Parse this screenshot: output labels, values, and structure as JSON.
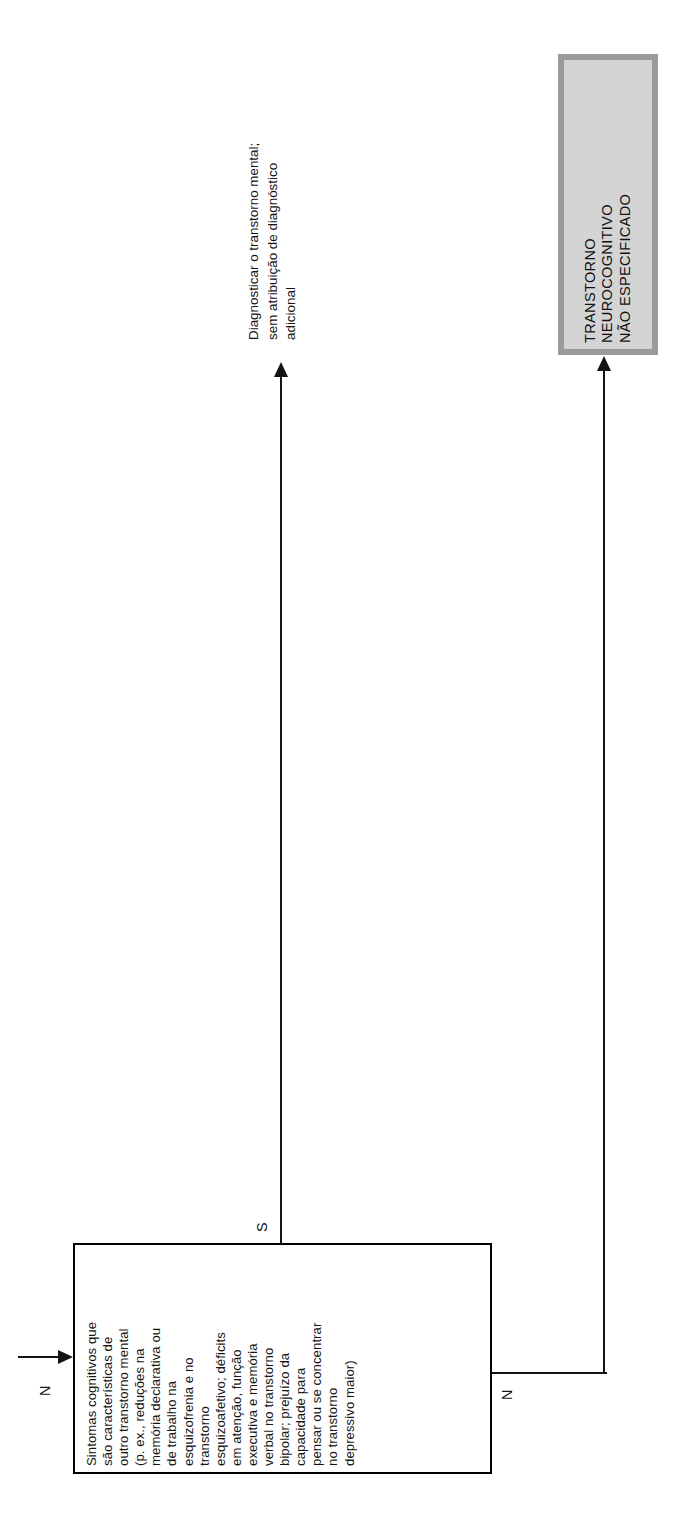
{
  "page": {
    "orientation": "rotated-90-ccw",
    "background_color": "#ffffff",
    "width": 676,
    "height": 1534
  },
  "diagram": {
    "type": "decision-tree-fragment",
    "language": "pt-BR",
    "criteria_node": {
      "id": "criteria-cognitive-symptoms",
      "shape": "rectangle",
      "fill_color": "#ffffff",
      "border_color": "#000000",
      "text": "Sintomas cognitivos que\nsão características de\noutro transtorno mental\n(p. ex., reduções  na\nmemória declarativa ou\nde trabalho na\nesquizofrenia e no\ntranstorno\nesquizoafetivo; déficits\nem atenção, função\nexecutiva e memória\nverbal no transtorno\nbipolar; prejuízo da\ncapacidade para\npensar ou se concentrar\nno transtorno\ndepressivo maior)"
    },
    "diagnosis_node": {
      "id": "dx-transtorno-neurocognitivo-nao-especificado",
      "shape": "rectangle-shadowed",
      "fill_color": "#d4d4d4",
      "border_color": "#9b9b9b",
      "text": "TRANSTORNO\nNEUROCOGNITIVO\nNÃO ESPECIFICADO"
    },
    "edges": [
      {
        "id": "edge-incoming",
        "from": "previous-step",
        "to": "criteria-cognitive-symptoms",
        "label": "N",
        "arrow": "into-criteria-left"
      },
      {
        "id": "edge-yes",
        "from": "criteria-cognitive-symptoms",
        "to": "annotation-diagnose-mental-disorder",
        "label": "S",
        "arrow": "up"
      },
      {
        "id": "edge-no",
        "from": "criteria-cognitive-symptoms",
        "to": "dx-transtorno-neurocognitivo-nao-especificado",
        "label": "N",
        "arrow": "up"
      }
    ],
    "annotation": {
      "id": "annotation-diagnose-mental-disorder",
      "text": "Diagnosticar o transtorno mental;\nsem atribuição de diagnóstico\nadicional"
    }
  }
}
